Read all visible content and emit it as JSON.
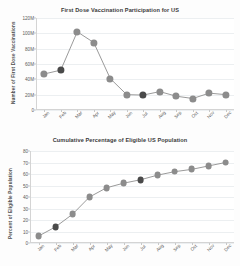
{
  "page": {
    "background": "#fdfdfd",
    "marker_color": "#8c8c8c",
    "marker_highlight_color": "#4a4a4a",
    "line_color": "#8f8f8f",
    "grid_color": "#eceff1"
  },
  "chart_data": [
    {
      "id": "first-dose",
      "type": "line",
      "title": "First Dose Vaccination Participation for US",
      "xlabel": "",
      "ylabel": "Number of First Dose Vaccinations",
      "categories": [
        "Jan",
        "Feb",
        "Mar",
        "Apr",
        "May",
        "Jun",
        "Jul",
        "Aug",
        "Sep",
        "Oct",
        "Nov",
        "Dec"
      ],
      "values": [
        47000000,
        52000000,
        102000000,
        88000000,
        41000000,
        20000000,
        19500000,
        24000000,
        18000000,
        15000000,
        22000000,
        20000000
      ],
      "ylim": [
        0,
        120000000
      ],
      "yticks": [
        0,
        20000000,
        40000000,
        60000000,
        80000000,
        100000000,
        120000000
      ],
      "ytick_labels": [
        "0",
        "20M",
        "40M",
        "60M",
        "80M",
        "100M",
        "120M"
      ],
      "highlight_indices": [
        1,
        6
      ],
      "grid": true,
      "legend": "none"
    },
    {
      "id": "cumulative-percent",
      "type": "line",
      "title": "Cumulative Percentage of Eligible US Population",
      "xlabel": "",
      "ylabel": "Percent of Eligible Population",
      "categories": [
        "Jan",
        "Feb",
        "Mar",
        "Apr",
        "May",
        "Jun",
        "Jul",
        "Aug",
        "Sep",
        "Oct",
        "Nov",
        "Dec"
      ],
      "values": [
        6,
        14,
        25,
        40,
        48,
        52,
        55,
        59,
        62,
        64,
        67,
        70
      ],
      "ylim": [
        0,
        80
      ],
      "yticks": [
        0,
        10,
        20,
        30,
        40,
        50,
        60,
        70,
        80
      ],
      "ytick_labels": [
        "0",
        "10",
        "20",
        "30",
        "40",
        "50",
        "60",
        "70",
        "80"
      ],
      "highlight_indices": [
        1,
        6
      ],
      "grid": true,
      "legend": "none"
    }
  ]
}
